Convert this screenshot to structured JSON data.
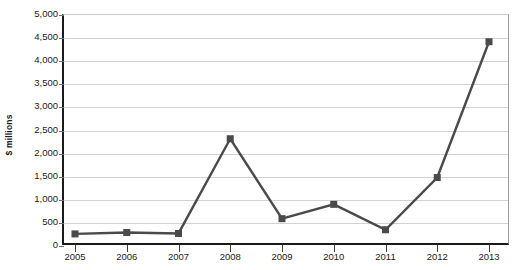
{
  "chart_data": {
    "type": "line",
    "title": "",
    "subtitle": "",
    "xlabel": "",
    "ylabel": "$ millions",
    "categories": [
      "2005",
      "2006",
      "2007",
      "2008",
      "2009",
      "2010",
      "2011",
      "2012",
      "2013"
    ],
    "values": [
      240,
      270,
      250,
      2300,
      570,
      880,
      330,
      1460,
      4400
    ],
    "series": [
      {
        "name": "",
        "values": [
          240,
          270,
          250,
          2300,
          570,
          880,
          330,
          1460,
          4400
        ]
      }
    ],
    "ylim": [
      0,
      5000
    ],
    "ytick_values": [
      0,
      500,
      1000,
      1500,
      2000,
      2500,
      3000,
      3500,
      4000,
      4500,
      5000
    ],
    "ytick_labels": [
      "0",
      "500",
      "1,000",
      "1,500",
      "2,000",
      "2,500",
      "3,000",
      "3,500",
      "4,000",
      "4,500",
      "5,000"
    ],
    "grid": true,
    "legend": "none",
    "marker": "square",
    "annotations": []
  },
  "style": {
    "series_color": "#4a4a4a",
    "marker_color": "#4a4a4a",
    "grid_color": "#d2d2d2",
    "axis_color": "#1a1a1a",
    "text_color": "#1a1a1a",
    "background": "#ffffff"
  }
}
